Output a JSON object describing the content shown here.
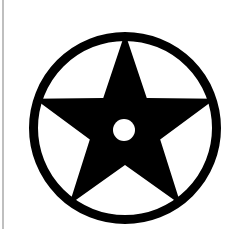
{
  "image": {
    "title": "Star Emblem",
    "width": 232,
    "height": 238,
    "background_color": "#ffffff",
    "ink_color": "#000000",
    "description": "Black five-pointed star enclosed in a black ring with a small white circular hole at the star's center, on a white background"
  },
  "border": {
    "name": "left-page-rule",
    "color": "#bfbfbf",
    "x": 2,
    "y": 0,
    "width": 2,
    "height": 229
  },
  "emblem": {
    "name": "star-in-circle-emblem",
    "ring": {
      "name": "outer-ring",
      "center_x": 125,
      "center_y": 128,
      "outer_radius": 96,
      "stroke_width": 9,
      "color": "#000000"
    },
    "star": {
      "name": "five-pointed-star",
      "center_x": 125,
      "center_y": 128,
      "outer_radius": 95,
      "inner_radius": 37,
      "points": 5,
      "rotation_deg": 0,
      "color": "#000000"
    },
    "center_hole": {
      "name": "center-hole",
      "center_x": 124,
      "center_y": 130,
      "radius": 11,
      "color": "#ffffff"
    }
  }
}
